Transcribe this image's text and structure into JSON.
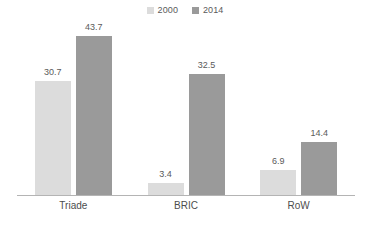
{
  "chart_data": {
    "type": "bar",
    "title": "",
    "subtitle": "",
    "xlabel": "",
    "ylabel": "",
    "categories": [
      "Triade",
      "BRIC",
      "RoW"
    ],
    "series": [
      {
        "name": "2000",
        "color": "#dcdcdc",
        "values": [
          30.7,
          3.4,
          6.9
        ]
      },
      {
        "name": "2014",
        "color": "#9a9a9a",
        "values": [
          43.7,
          32.5,
          14.4
        ]
      }
    ],
    "value_labels": [
      [
        "30.7",
        "43.7"
      ],
      [
        "3.4",
        "32.5"
      ],
      [
        "6.9",
        "14.4"
      ]
    ],
    "ylim": [
      0,
      46.4
    ],
    "grid": false,
    "axis": {
      "show_x_axis_line": true,
      "show_y_axis": false,
      "axis_color": "#b4b4b4"
    },
    "legend": {
      "position": "top-center",
      "entries": [
        {
          "label": "2000",
          "color": "#dcdcdc",
          "marker": "square-swatch"
        },
        {
          "label": "2014",
          "color": "#9a9a9a",
          "marker": "square-swatch"
        }
      ]
    },
    "data_labels_shown": true,
    "background": "#ffffff",
    "text_color": "#5a5a5a"
  }
}
